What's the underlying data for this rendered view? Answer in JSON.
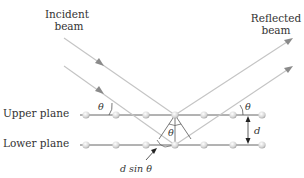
{
  "labels": {
    "incident_line1": "Incident",
    "incident_line2": "beam",
    "reflected_line1": "Reflected",
    "reflected_line2": "beam",
    "upper_plane": "Upper plane",
    "lower_plane": "Lower plane",
    "theta": "θ",
    "d": "d",
    "path_difference": "d sin θ"
  },
  "colors": {
    "beam": "#b8b8b8",
    "beam_arrow": "#8a8a8a",
    "plane_line": "#444444",
    "atom": "#dcdcdc",
    "text": "#333333"
  }
}
